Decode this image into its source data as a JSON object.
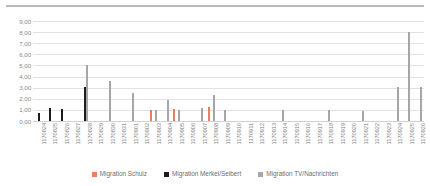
{
  "chart_data": {
    "type": "bar",
    "title": "",
    "subtitle": "",
    "xlabel": "",
    "ylabel": "",
    "ylim": [
      0,
      9
    ],
    "ytick_labels": [
      "9,00",
      "8,00",
      "7,00",
      "6,00",
      "5,00",
      "4,00",
      "3,00",
      "2,00",
      "1,00",
      "0,00"
    ],
    "ytick_values": [
      9,
      8,
      7,
      6,
      5,
      4,
      3,
      2,
      1,
      0
    ],
    "grid": true,
    "legend_position": "bottom",
    "categories": [
      "170824",
      "170825",
      "170826",
      "170827",
      "170828",
      "170829",
      "170830",
      "170831",
      "170901",
      "170902",
      "170903",
      "170904",
      "170905",
      "170906",
      "170907",
      "170908",
      "170909",
      "170910",
      "170911",
      "170912",
      "170913",
      "170914",
      "170915",
      "170916",
      "170917",
      "170918",
      "170919",
      "170920",
      "170921",
      "170922",
      "170923",
      "170924",
      "170925",
      "170926"
    ],
    "series": [
      {
        "name": "Migration Schulz",
        "color": "#ed7d5f",
        "values": [
          0,
          0,
          0,
          0,
          0,
          0,
          0,
          0,
          0,
          0,
          0.95,
          0,
          1.05,
          0,
          0,
          1.25,
          0,
          0,
          0,
          0,
          0,
          0,
          0,
          0,
          0,
          0,
          0,
          0,
          0,
          0,
          0,
          0,
          0,
          0
        ]
      },
      {
        "name": "Migration Merkel/Seibert",
        "color": "#1c1c1c",
        "values": [
          0.75,
          1.15,
          1.1,
          0,
          3.05,
          0,
          0,
          0,
          0,
          0,
          0,
          0,
          0,
          0,
          0,
          0,
          0,
          0,
          0,
          0,
          0,
          0,
          0,
          0,
          0,
          0,
          0,
          0,
          0,
          0,
          0,
          0,
          0,
          0
        ]
      },
      {
        "name": "Migration TV/Nachrichten",
        "color": "#a6a6a6",
        "values": [
          0,
          0,
          0,
          0,
          5.0,
          0,
          3.6,
          0,
          2.55,
          0,
          1.0,
          1.85,
          0.95,
          0,
          1.2,
          2.3,
          0.95,
          0,
          0,
          0,
          0,
          0.95,
          0,
          0,
          0,
          0.95,
          0,
          0,
          0.9,
          0,
          0,
          3.05,
          8.0,
          3.1
        ]
      }
    ]
  },
  "legend": {
    "items": [
      {
        "label": "Migration Schulz",
        "color": "#ed7d5f"
      },
      {
        "label": "Migration Merkel/Seibert",
        "color": "#1c1c1c"
      },
      {
        "label": "Migration TV/Nachrichten",
        "color": "#a6a6a6"
      }
    ]
  }
}
